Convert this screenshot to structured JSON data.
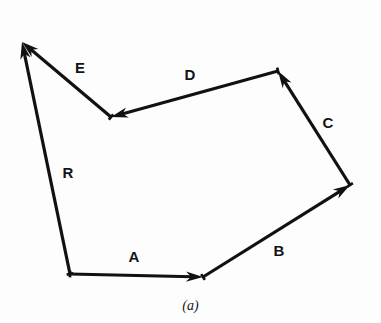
{
  "figure": {
    "caption": "(a)",
    "caption_x": 190,
    "caption_y": 298,
    "background_color": "#fdfdfd",
    "stroke_color": "#111111",
    "stroke_width": 3.2,
    "width": 381,
    "height": 323
  },
  "chart_data": {
    "type": "diagram",
    "subtype": "vector-polygon",
    "title": "(a)",
    "xlabel": "",
    "ylabel": "",
    "grid": false,
    "legend": "none",
    "coordinate_space": "screen pixels, origin top-left, y increases downward",
    "points": {
      "origin": [
        70,
        274
      ],
      "p1": [
        203,
        277
      ],
      "p2": [
        350,
        185
      ],
      "p3": [
        278,
        71
      ],
      "p4": [
        111,
        117
      ],
      "apex": [
        22,
        42
      ]
    },
    "vectors": [
      {
        "name": "A",
        "label": "A",
        "from": [
          70,
          274
        ],
        "to": [
          203,
          277
        ],
        "arrow_at": "to",
        "label_pos": [
          134,
          256
        ],
        "dx": 133,
        "dy": 3,
        "length": 133,
        "angle_deg": 358.7
      },
      {
        "name": "B",
        "label": "B",
        "from": [
          203,
          277
        ],
        "to": [
          350,
          185
        ],
        "arrow_at": "to",
        "label_pos": [
          279,
          250
        ],
        "dx": 147,
        "dy": -92,
        "length": 173,
        "angle_deg": 32.0
      },
      {
        "name": "C",
        "label": "C",
        "from": [
          350,
          185
        ],
        "to": [
          278,
          71
        ],
        "arrow_at": "to",
        "label_pos": [
          328,
          122
        ],
        "dx": -72,
        "dy": -114,
        "length": 135,
        "angle_deg": 122.3
      },
      {
        "name": "D",
        "label": "D",
        "from": [
          278,
          71
        ],
        "to": [
          111,
          117
        ],
        "arrow_at": "to",
        "label_pos": [
          190,
          74
        ],
        "dx": -167,
        "dy": 46,
        "length": 173,
        "angle_deg": 195.4
      },
      {
        "name": "E",
        "label": "E",
        "from": [
          111,
          117
        ],
        "to": [
          22,
          42
        ],
        "arrow_at": "to",
        "label_pos": [
          80,
          67
        ],
        "dx": -89,
        "dy": -75,
        "length": 116,
        "angle_deg": 139.9
      },
      {
        "name": "R",
        "label": "R",
        "from": [
          70,
          274
        ],
        "to": [
          22,
          42
        ],
        "arrow_at": "to",
        "label_pos": [
          68,
          172
        ],
        "dx": -48,
        "dy": -232,
        "length": 237,
        "angle_deg": 101.7,
        "role": "resultant"
      }
    ],
    "labels": [
      "A",
      "B",
      "C",
      "D",
      "E",
      "R"
    ]
  }
}
